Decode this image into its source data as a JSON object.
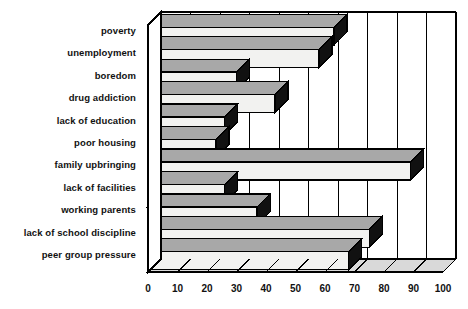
{
  "chart_data": {
    "type": "bar",
    "orientation": "horizontal",
    "style": "3d-horizontal-bar",
    "title": "",
    "subtitle": "",
    "xlabel": "",
    "ylabel": "",
    "xlim": [
      0,
      100
    ],
    "xticks": [
      0,
      10,
      20,
      30,
      40,
      50,
      60,
      70,
      80,
      90,
      100
    ],
    "xtick_labels": [
      "0",
      "10",
      "20",
      "30",
      "40",
      "50",
      "60",
      "70",
      "80",
      "90",
      "100"
    ],
    "grid": true,
    "grid_axis": "x",
    "legend": false,
    "legend_position": "none",
    "categories": [
      "poverty",
      "unemployment",
      "boredom",
      "drug addiction",
      "lack of education",
      "poor housing",
      "family upbringing",
      "lack of facilities",
      "working parents",
      "lack of school discipline",
      "peer group pressure"
    ],
    "values": [
      63,
      58,
      30,
      43,
      26,
      23,
      89,
      26,
      37,
      75,
      68
    ],
    "series": [
      {
        "name": "percentage",
        "values": [
          63,
          58,
          30,
          43,
          26,
          23,
          89,
          26,
          37,
          75,
          68
        ]
      }
    ],
    "colors": {
      "bar_face": "#f2f2f0",
      "bar_top": "#a8a8a8",
      "bar_side": "#111111",
      "outline": "#000000",
      "floor": "#d9d9d9",
      "background": "#ffffff",
      "text": "#111111",
      "gridline": "#000000"
    }
  },
  "axis": {
    "x_start_px": 148,
    "x_end_px": 443,
    "depth_px": 13
  }
}
